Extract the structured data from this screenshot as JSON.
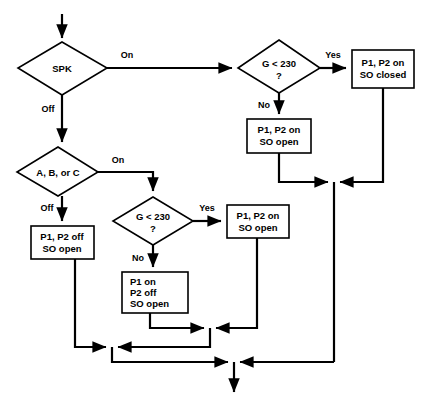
{
  "diagram": {
    "type": "flowchart",
    "title": "",
    "colors": {
      "background": "#ffffff",
      "stroke": "#000000",
      "fill": "#ffffff",
      "text": "#000000"
    },
    "nodes": [
      {
        "id": "spk",
        "shape": "diamond",
        "label": "SPK",
        "lines": [
          "SPK"
        ]
      },
      {
        "id": "g230-top",
        "shape": "diamond",
        "label": "G < 230 ?",
        "lines": [
          "G < 230",
          "?"
        ]
      },
      {
        "id": "p1p2-on-so-closed",
        "shape": "rect",
        "label": "P1, P2 on SO closed",
        "lines": [
          "P1, P2 on",
          "SO closed"
        ]
      },
      {
        "id": "p1p2-on-so-open-top",
        "shape": "rect",
        "label": "P1, P2 on SO open",
        "lines": [
          "P1, P2 on",
          "SO open"
        ]
      },
      {
        "id": "abc",
        "shape": "diamond",
        "label": "A, B, or C",
        "lines": [
          "A, B, or C"
        ]
      },
      {
        "id": "g230-bottom",
        "shape": "diamond",
        "label": "G < 230 ?",
        "lines": [
          "G < 230",
          "?"
        ]
      },
      {
        "id": "p1p2-off-so-open",
        "shape": "rect",
        "label": "P1, P2 off SO open",
        "lines": [
          "P1, P2 off",
          "SO open"
        ]
      },
      {
        "id": "p1p2-on-so-open-bottom",
        "shape": "rect",
        "label": "P1, P2 on SO open",
        "lines": [
          "P1, P2 on",
          "SO open"
        ]
      },
      {
        "id": "p1-on-p2-off-so-open",
        "shape": "rect",
        "label": "P1 on P2 off SO open",
        "lines": [
          "P1 on",
          "P2 off",
          "SO open"
        ]
      }
    ],
    "edge_labels": {
      "spk_on": "On",
      "spk_off": "Off",
      "g230_top_yes": "Yes",
      "g230_top_no": "No",
      "abc_on": "On",
      "abc_off": "Off",
      "g230_bottom_yes": "Yes",
      "g230_bottom_no": "No"
    },
    "edges": [
      {
        "from": "start",
        "to": "spk",
        "label": ""
      },
      {
        "from": "spk",
        "to": "g230-top",
        "label": "On"
      },
      {
        "from": "spk",
        "to": "abc",
        "label": "Off"
      },
      {
        "from": "g230-top",
        "to": "p1p2-on-so-closed",
        "label": "Yes"
      },
      {
        "from": "g230-top",
        "to": "p1p2-on-so-open-top",
        "label": "No"
      },
      {
        "from": "abc",
        "to": "g230-bottom",
        "label": "On"
      },
      {
        "from": "abc",
        "to": "p1p2-off-so-open",
        "label": "Off"
      },
      {
        "from": "g230-bottom",
        "to": "p1p2-on-so-open-bottom",
        "label": "Yes"
      },
      {
        "from": "g230-bottom",
        "to": "p1-on-p2-off-so-open",
        "label": "No"
      },
      {
        "from": "p1p2-on-so-closed",
        "to": "merge-right",
        "label": ""
      },
      {
        "from": "p1p2-on-so-open-top",
        "to": "merge-top",
        "label": ""
      },
      {
        "from": "p1p2-on-so-open-bottom",
        "to": "merge-mid",
        "label": ""
      },
      {
        "from": "p1-on-p2-off-so-open",
        "to": "merge-mid",
        "label": ""
      },
      {
        "from": "p1p2-off-so-open",
        "to": "merge-low",
        "label": ""
      },
      {
        "from": "merge-low",
        "to": "end",
        "label": ""
      }
    ]
  }
}
